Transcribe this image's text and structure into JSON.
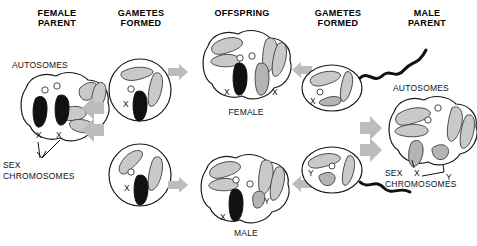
{
  "figure": {
    "title_headers": [
      {
        "id": "female-parent",
        "label": "FEMALE\nPARENT",
        "x": 17,
        "y": 8
      },
      {
        "id": "gametes-left",
        "label": "GAMETES\nFORMED",
        "x": 110,
        "y": 8
      },
      {
        "id": "offspring",
        "label": "OFFSPRING",
        "x": 210,
        "y": 8
      },
      {
        "id": "gametes-right",
        "label": "GAMETES\nFORMED",
        "x": 305,
        "y": 8
      },
      {
        "id": "male-parent",
        "label": "MALE\nPARENT",
        "x": 400,
        "y": 8
      }
    ],
    "annotations": [
      {
        "id": "autosomes-left",
        "label": "AUTOSOMES",
        "x": 12,
        "y": 60
      },
      {
        "id": "sex-chromosomes-left",
        "label": "SEX\nCHROMOSOMES",
        "x": 3,
        "y": 160
      },
      {
        "id": "autosomes-right",
        "label": "AUTOSOMES",
        "x": 393,
        "y": 83
      },
      {
        "id": "sex-chromosomes-right",
        "label": "SEX\nCHROMOSOMES",
        "x": 385,
        "y": 168
      },
      {
        "id": "offspring-female",
        "label": "FEMALE",
        "x": 226,
        "y": 107
      },
      {
        "id": "offspring-male",
        "label": "MALE",
        "x": 232,
        "y": 228
      }
    ],
    "cells": [
      {
        "id": "female-parent-cell",
        "genotype": "XX",
        "chromosome_labels": [
          "X",
          "X"
        ]
      },
      {
        "id": "female-gamete-top",
        "genotype": "X",
        "chromosome_labels": [
          "X"
        ]
      },
      {
        "id": "female-gamete-bottom",
        "genotype": "X",
        "chromosome_labels": [
          "X"
        ]
      },
      {
        "id": "offspring-female-cell",
        "genotype": "XX",
        "chromosome_labels": [
          "X",
          "X"
        ]
      },
      {
        "id": "offspring-male-cell",
        "genotype": "XY",
        "chromosome_labels": [
          "X",
          "Y"
        ]
      },
      {
        "id": "male-gamete-top",
        "genotype": "X",
        "chromosome_labels": [
          "X"
        ]
      },
      {
        "id": "male-gamete-bottom",
        "genotype": "Y",
        "chromosome_labels": [
          "Y"
        ]
      },
      {
        "id": "male-parent-cell",
        "genotype": "XY",
        "chromosome_labels": [
          "X",
          "Y"
        ]
      }
    ],
    "chromosome_marks": {
      "female_parent_x1": "X",
      "female_parent_x2": "X",
      "female_gamete_top_x": "X",
      "female_gamete_bottom_x": "X",
      "offspring_female_x1": "X",
      "offspring_female_x2": "X",
      "offspring_male_x": "X",
      "offspring_male_y": "Y",
      "male_gamete_top_x": "X",
      "male_gamete_bottom_y": "Y",
      "male_parent_x": "X",
      "male_parent_y": "Y"
    },
    "colors": {
      "outline": "#1a1a1a",
      "maternal_chromosome": "#111111",
      "paternal_chromosome": "#9b9b9b",
      "arrow": "#b9b9b9",
      "background": "#ffffff"
    }
  }
}
